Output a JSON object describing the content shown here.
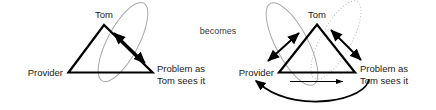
{
  "figure": {
    "connector_label": "becomes",
    "left_diagram": {
      "name": "initial-triangle",
      "vertices": {
        "top": "Tom",
        "bottom_left": "Provider",
        "bottom_right_line1": "Problem as",
        "bottom_right_line2": "Tom sees it"
      },
      "relations": [
        {
          "name": "tom-problem-double-arrow",
          "from": "Tom",
          "to": "Problem as Tom sees it",
          "style": "double-headed",
          "weight": "thick"
        }
      ],
      "grouping": [
        {
          "name": "tom-problem-ellipse",
          "style": "solid",
          "color": "#a8a8a8",
          "encloses": [
            "Tom",
            "Problem as Tom sees it"
          ]
        }
      ]
    },
    "right_diagram": {
      "name": "resulting-triangle",
      "vertices": {
        "top": "Tom",
        "bottom_left": "Provider",
        "bottom_right_line1": "Problem as",
        "bottom_right_line2": "Tom sees it"
      },
      "relations": [
        {
          "name": "provider-tom-double-arrow",
          "from": "Provider",
          "to": "Tom",
          "style": "double-headed",
          "weight": "thick"
        },
        {
          "name": "tom-problem-double-arrow",
          "from": "Tom",
          "to": "Problem as Tom sees it",
          "style": "double-headed",
          "weight": "thick"
        },
        {
          "name": "provider-problem-arrow",
          "from": "Provider",
          "to": "Problem as Tom sees it",
          "style": "single-headed",
          "weight": "thin"
        },
        {
          "name": "problem-provider-curve-arrow",
          "from": "Problem as Tom sees it",
          "to": "Provider",
          "style": "single-headed-curve",
          "weight": "thick"
        }
      ],
      "grouping": [
        {
          "name": "provider-tom-ellipse",
          "style": "solid",
          "color": "#a8a8a8",
          "encloses": [
            "Provider",
            "Tom"
          ]
        },
        {
          "name": "tom-problem-ellipse",
          "style": "dotted",
          "color": "#b9b9b9",
          "encloses": [
            "Tom",
            "Problem as Tom sees it"
          ]
        }
      ]
    }
  },
  "colors": {
    "stroke": "#000000",
    "text": "#1a1a1a",
    "ellipse_solid": "#a8a8a8",
    "ellipse_dotted": "#b9b9b9",
    "background": "#ffffff"
  }
}
